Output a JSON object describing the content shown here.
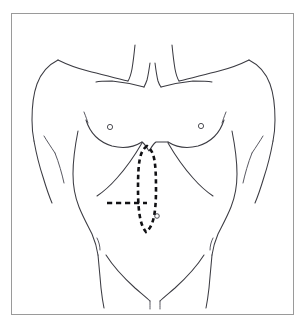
{
  "figure": {
    "view": "anterior",
    "frame": {
      "border_color": "#9a9a9a",
      "background_color": "#ffffff",
      "x": 11,
      "y": 13,
      "width": 283,
      "height": 302
    },
    "line_color": "#3b3b42",
    "incision_color": "#111114"
  },
  "anatomy": {
    "landmarks": [
      {
        "name": "right-nipple",
        "label": "nipple",
        "cx": 110,
        "cy": 127,
        "r": 2.6
      },
      {
        "name": "left-nipple",
        "label": "nipple",
        "cx": 201,
        "cy": 126,
        "r": 2.6
      },
      {
        "name": "umbilicus",
        "label": "umbilicus",
        "cx": 157,
        "cy": 216,
        "r": 2.3
      }
    ],
    "regions": [
      "neck",
      "clavicles",
      "shoulders",
      "upper arms",
      "pectoral region",
      "costal margin",
      "abdomen",
      "iliac crest",
      "inguinal creases",
      "pelvis"
    ]
  },
  "incisions": [
    {
      "name": "midline-vertical-incision",
      "label": "upper midline laparotomy incision",
      "style": "dashed elliptical outline",
      "orientation": "vertical",
      "top_y": 146,
      "bottom_y": 232,
      "center_x": 147,
      "half_width": 9
    },
    {
      "name": "transverse-incision",
      "label": "transverse extension incision",
      "style": "dashed straight line",
      "orientation": "horizontal",
      "y": 203,
      "x_start": 107,
      "x_end": 147
    }
  ]
}
